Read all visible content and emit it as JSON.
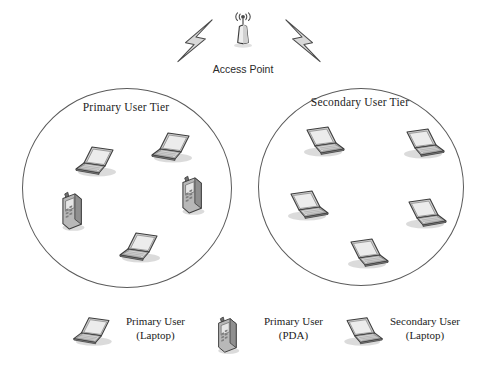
{
  "diagram": {
    "title_text": "Cognitive radio two-tier access network",
    "access_point": {
      "label": "Access Point",
      "icon": "access-point-antenna-icon",
      "x": 243,
      "y": 46
    },
    "links": [
      {
        "name": "link-primary-tier",
        "icon": "lightning-bolt-icon",
        "side": "left"
      },
      {
        "name": "link-secondary-tier",
        "icon": "lightning-bolt-icon",
        "side": "right"
      }
    ],
    "tiers": [
      {
        "id": "primary",
        "label": "Primary User Tier",
        "devices": [
          {
            "type": "laptop",
            "icon": "laptop-icon",
            "x": 72,
            "y": 142,
            "flip": false
          },
          {
            "type": "laptop",
            "icon": "laptop-icon",
            "x": 148,
            "y": 128,
            "flip": false
          },
          {
            "type": "pda",
            "icon": "pda-icon",
            "x": 182,
            "y": 174,
            "flip": false
          },
          {
            "type": "pda",
            "icon": "pda-icon",
            "x": 62,
            "y": 190,
            "flip": false
          },
          {
            "type": "laptop",
            "icon": "laptop-icon",
            "x": 118,
            "y": 228,
            "flip": false
          }
        ]
      },
      {
        "id": "secondary",
        "label": "Secondary User Tier",
        "devices": [
          {
            "type": "laptop",
            "icon": "laptop-icon",
            "x": 302,
            "y": 124,
            "flip": true
          },
          {
            "type": "laptop",
            "icon": "laptop-icon",
            "x": 404,
            "y": 126,
            "flip": true
          },
          {
            "type": "laptop",
            "icon": "laptop-icon",
            "x": 288,
            "y": 188,
            "flip": true
          },
          {
            "type": "laptop",
            "icon": "laptop-icon",
            "x": 408,
            "y": 196,
            "flip": true
          },
          {
            "type": "laptop",
            "icon": "laptop-icon",
            "x": 348,
            "y": 236,
            "flip": true
          }
        ]
      }
    ],
    "legend": {
      "items": [
        {
          "icon": "laptop-icon",
          "line1": "Primary User",
          "line2": "(Laptop)"
        },
        {
          "icon": "pda-icon",
          "line1": "Primary User",
          "line2": "(PDA)"
        },
        {
          "icon": "laptop-icon",
          "line1": "Secondary User",
          "line2": "(Laptop)"
        }
      ]
    },
    "colors": {
      "circle_stroke": "#5b5b5b",
      "device_outline": "#3d3d3d",
      "device_fill_light": "#e8e8e8",
      "device_fill_mid": "#b9b9b9",
      "device_fill_dark": "#8c8c8c",
      "bolt_fill": "#d9d9d9",
      "text": "#1c1c1c",
      "background": "#ffffff"
    }
  }
}
